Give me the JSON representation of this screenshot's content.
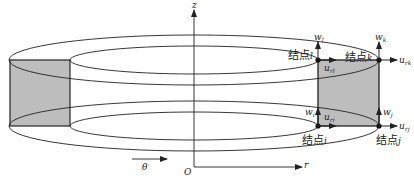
{
  "diagram": {
    "type": "axisymmetric ring element",
    "colors": {
      "line": "#222222",
      "fill": "#bdbdbd",
      "background": "#ffffff"
    },
    "axes": {
      "z": "z",
      "r": "r",
      "origin": "O",
      "theta": "θ"
    },
    "nodes": [
      {
        "id": "i",
        "label": "结点",
        "letter": "i",
        "u": "u",
        "u_sub": "ri",
        "w": "w",
        "w_sub": "i"
      },
      {
        "id": "j",
        "label": "结点",
        "letter": "j",
        "u": "u",
        "u_sub": "rj",
        "w": "w",
        "w_sub": "j"
      },
      {
        "id": "k",
        "label": "结点",
        "letter": "k",
        "u": "u",
        "u_sub": "rk",
        "w": "w",
        "w_sub": "k"
      },
      {
        "id": "l",
        "label": "结点",
        "letter": "l",
        "u": "u",
        "u_sub": "rl",
        "w": "w",
        "w_sub": "l"
      }
    ]
  }
}
